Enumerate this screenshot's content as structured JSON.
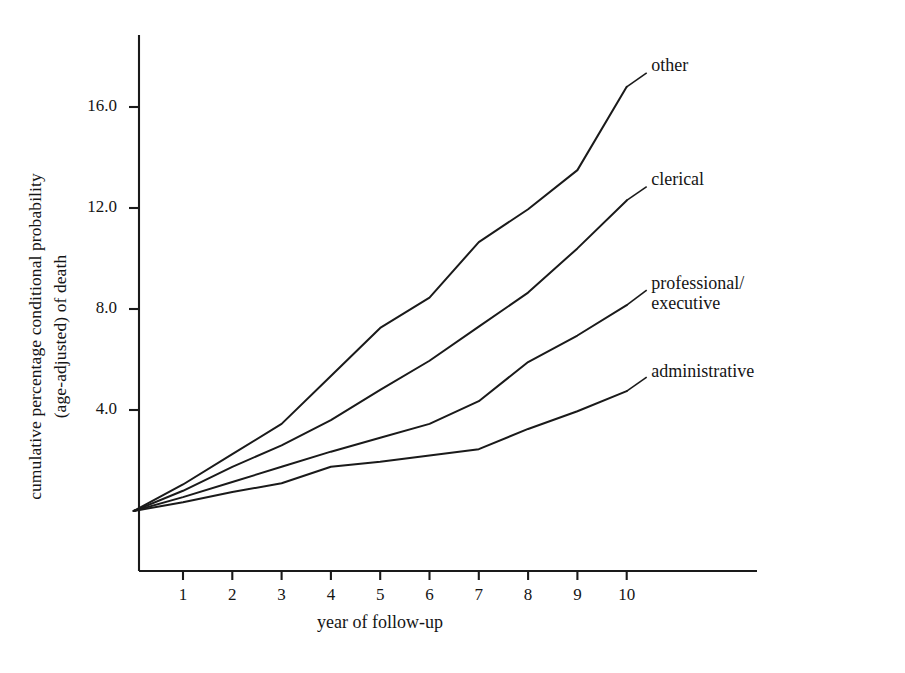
{
  "chart_data": {
    "type": "line",
    "title": "",
    "xlabel": "year of follow-up",
    "ylabel": "cumulative percentage conditional probability\n(age-adjusted) of death",
    "ylabel_line1": "cumulative percentage conditional probability",
    "ylabel_line2": "(age-adjusted) of death",
    "x": [
      0,
      1,
      2,
      3,
      4,
      5,
      6,
      7,
      8,
      9,
      10
    ],
    "xticks": [
      1,
      2,
      3,
      4,
      5,
      6,
      7,
      8,
      9,
      10
    ],
    "xtick_labels": [
      "1",
      "2",
      "3",
      "4",
      "5",
      "6",
      "7",
      "8",
      "9",
      "10"
    ],
    "yticks": [
      4.0,
      8.0,
      12.0,
      16.0
    ],
    "ytick_labels": [
      "4.0",
      "8.0",
      "12.0",
      "16.0"
    ],
    "xlim": [
      0,
      10.4
    ],
    "ylim": [
      -2.6,
      18.5
    ],
    "grid": false,
    "legend_position": "right-inline-labels",
    "line_color": "#1a1a1a",
    "series": [
      {
        "name": "other",
        "label": "other",
        "values": [
          0.0,
          1.05,
          2.25,
          3.45,
          5.35,
          7.25,
          8.45,
          10.65,
          11.95,
          13.5,
          16.8
        ]
      },
      {
        "name": "clerical",
        "label": "clerical",
        "values": [
          0.0,
          0.8,
          1.75,
          2.6,
          3.6,
          4.8,
          5.95,
          7.3,
          8.65,
          10.4,
          12.3
        ]
      },
      {
        "name": "professional-executive",
        "label": "professional/\nexecutive",
        "values": [
          0.0,
          0.55,
          1.15,
          1.75,
          2.35,
          2.9,
          3.45,
          4.35,
          5.9,
          6.95,
          8.15
        ]
      },
      {
        "name": "administrative",
        "label": "administrative",
        "values": [
          0.0,
          0.35,
          0.75,
          1.1,
          1.75,
          1.95,
          2.2,
          2.45,
          3.25,
          3.95,
          4.75
        ]
      }
    ],
    "annotations": [
      {
        "name": "other-label",
        "text": "other",
        "x": 10.05,
        "y": 17.6
      },
      {
        "name": "clerical-label",
        "text": "clerical",
        "x": 10.05,
        "y": 13.05
      },
      {
        "name": "professional-executive-label",
        "text": "professional/\nexecutive",
        "x": 10.05,
        "y": 8.95
      },
      {
        "name": "administrative-label",
        "text": "administrative",
        "x": 10.05,
        "y": 5.45
      }
    ]
  }
}
